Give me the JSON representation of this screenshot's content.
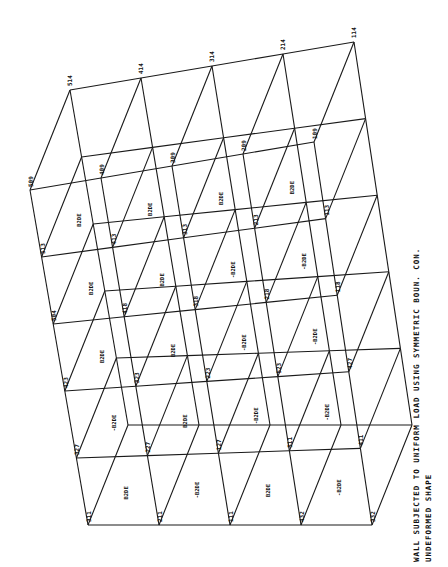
{
  "figure": {
    "caption_line1": "WALL SUBJECTED TO UNIFORM LOAD USING SYMMETRIC  BOUN. CON.",
    "caption_line2": "UNDEFORMED SHAPE",
    "line_color": "#1a1a1a",
    "background": "#ffffff"
  },
  "mesh": {
    "top_edge_nodes": [
      {
        "id": "514",
        "x": 70,
        "y": 90
      },
      {
        "id": "414",
        "x": 141,
        "y": 80
      },
      {
        "id": "314",
        "x": 213,
        "y": 67
      },
      {
        "id": "214",
        "x": 285,
        "y": 54
      },
      {
        "id": "114",
        "x": 357,
        "y": 41
      }
    ],
    "labels_visible": [
      "514",
      "414",
      "314",
      "214",
      "114",
      "509",
      "409",
      "309",
      "209",
      "109",
      "513",
      "413",
      "313",
      "213",
      "113",
      "504",
      "418",
      "318",
      "218",
      "118",
      "423",
      "323",
      "223",
      "523",
      "427",
      "327",
      "227",
      "127",
      "511",
      "411",
      "311",
      "211",
      "111",
      "432",
      "332",
      "232",
      "132",
      "516",
      "416",
      "316",
      "216",
      "116",
      "531",
      "431",
      "331",
      "231",
      "131",
      "536",
      "436",
      "336",
      "236",
      "136",
      "520",
      "420",
      "320",
      "220",
      "120"
    ],
    "element_labels": [
      "B2DE",
      "B2DE",
      "B2DE",
      "B2DE",
      "B2DE",
      "B2DE",
      "-B2DE",
      "-B2DE",
      "B2DE",
      "B2DE",
      "-B2DE",
      "-B2DE",
      "-B2DE",
      "B2DE",
      "-B2DE",
      "-B2DE",
      "B2DE",
      "-B2DE",
      "B2DE",
      "-B2DE",
      "B2DE",
      "-B2DE",
      "B2DE",
      "-B2DE"
    ]
  }
}
